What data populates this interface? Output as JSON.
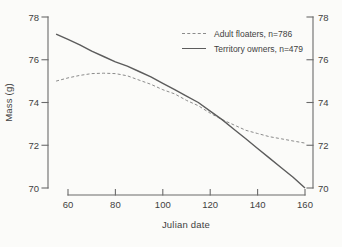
{
  "figure": {
    "y_axis_label": "Mass (g)",
    "x_axis_label": "Julian date"
  },
  "colors": {
    "background": "#fbfbf9",
    "axis": "#6b6b6b",
    "tick_text": "#3f3f3f",
    "solid_line": "#5c5c5c",
    "dashed_line": "#8b8b8b"
  },
  "chart_data": {
    "type": "line",
    "title": "",
    "xlabel": "Julian date",
    "ylabel": "Mass (g)",
    "xlim": [
      55,
      160
    ],
    "ylim": [
      70,
      78
    ],
    "x_ticks": [
      60,
      80,
      100,
      120,
      140,
      160
    ],
    "y_ticks": [
      70,
      72,
      74,
      76,
      78
    ],
    "grid": false,
    "legend_position": "top-right",
    "dual_y_axis": true,
    "series": [
      {
        "name": "Adult floaters, n=786",
        "style": "dashed",
        "color": "#8b8b8b",
        "x": [
          55,
          60,
          65,
          70,
          75,
          80,
          85,
          90,
          95,
          100,
          105,
          110,
          115,
          120,
          125,
          130,
          135,
          140,
          145,
          150,
          155,
          160
        ],
        "y": [
          75.0,
          75.15,
          75.27,
          75.35,
          75.37,
          75.35,
          75.25,
          75.05,
          74.85,
          74.6,
          74.4,
          74.1,
          73.85,
          73.5,
          73.2,
          72.95,
          72.7,
          72.55,
          72.4,
          72.3,
          72.2,
          72.1
        ]
      },
      {
        "name": "Territory owners, n=479",
        "style": "solid",
        "color": "#5c5c5c",
        "x": [
          55,
          60,
          65,
          70,
          75,
          80,
          85,
          90,
          95,
          100,
          105,
          110,
          115,
          120,
          125,
          130,
          135,
          140,
          145,
          150,
          155,
          160
        ],
        "y": [
          77.2,
          76.95,
          76.7,
          76.4,
          76.15,
          75.9,
          75.7,
          75.45,
          75.2,
          74.9,
          74.6,
          74.3,
          74.0,
          73.6,
          73.2,
          72.75,
          72.3,
          71.85,
          71.4,
          70.95,
          70.5,
          70.0
        ]
      }
    ]
  }
}
